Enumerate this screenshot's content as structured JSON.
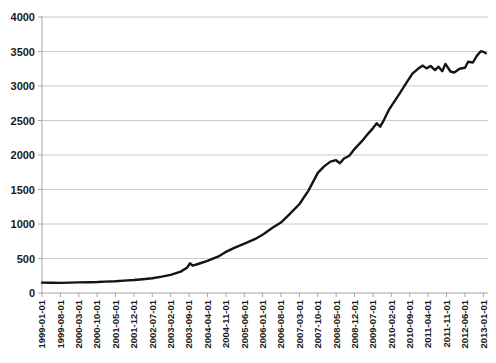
{
  "chart": {
    "background": "#ffffff",
    "line_color": "#141414",
    "grid_color": "#c9c9c9",
    "axis_color": "#a6a6a6",
    "label_color": "#1a1a1a"
  },
  "chart_data": {
    "type": "line",
    "title": "",
    "xlabel": "",
    "ylabel": "",
    "legend": "none",
    "grid": "horizontal",
    "ylim": [
      0,
      4000
    ],
    "y_ticks": [
      0,
      500,
      1000,
      1500,
      2000,
      2500,
      3000,
      3500,
      4000
    ],
    "y_tick_labels": [
      "0",
      "500",
      "1000",
      "1500",
      "2000",
      "2500",
      "3000",
      "3500",
      "4000"
    ],
    "x_tick_labels": [
      "1999-01-01",
      "1999-08-01",
      "2000-03-01",
      "2000-10-01",
      "2001-05-01",
      "2001-12-01",
      "2002-07-01",
      "2003-02-01",
      "2003-09-01",
      "2004-04-01",
      "2004-11-01",
      "2005-06-01",
      "2006-01-01",
      "2006-08-01",
      "2007-03-01",
      "2007-10-01",
      "2008-05-01",
      "2008-12-01",
      "2009-07-01",
      "2010-02-01",
      "2010-09-01",
      "2011-04-01",
      "2011-11-01",
      "2012-06-01",
      "2013-01-01"
    ],
    "x_tick_interval_months": 7,
    "xlim_years": [
      1999.0,
      2013.15
    ],
    "series": [
      {
        "name": "series-1",
        "points": [
          [
            1999.0,
            150
          ],
          [
            1999.3,
            148
          ],
          [
            1999.58,
            147
          ],
          [
            1999.9,
            150
          ],
          [
            2000.17,
            153
          ],
          [
            2000.5,
            156
          ],
          [
            2000.75,
            160
          ],
          [
            2001.0,
            165
          ],
          [
            2001.33,
            171
          ],
          [
            2001.6,
            179
          ],
          [
            2001.92,
            189
          ],
          [
            2002.2,
            200
          ],
          [
            2002.5,
            215
          ],
          [
            2002.8,
            237
          ],
          [
            2003.08,
            262
          ],
          [
            2003.4,
            310
          ],
          [
            2003.6,
            365
          ],
          [
            2003.7,
            430
          ],
          [
            2003.78,
            395
          ],
          [
            2003.95,
            420
          ],
          [
            2004.25,
            465
          ],
          [
            2004.6,
            530
          ],
          [
            2004.83,
            595
          ],
          [
            2005.1,
            655
          ],
          [
            2005.42,
            715
          ],
          [
            2005.75,
            780
          ],
          [
            2006.0,
            845
          ],
          [
            2006.3,
            940
          ],
          [
            2006.58,
            1020
          ],
          [
            2006.85,
            1140
          ],
          [
            2007.17,
            1290
          ],
          [
            2007.45,
            1480
          ],
          [
            2007.75,
            1740
          ],
          [
            2007.95,
            1835
          ],
          [
            2008.15,
            1905
          ],
          [
            2008.33,
            1925
          ],
          [
            2008.45,
            1880
          ],
          [
            2008.58,
            1950
          ],
          [
            2008.75,
            1990
          ],
          [
            2008.92,
            2090
          ],
          [
            2009.15,
            2200
          ],
          [
            2009.35,
            2310
          ],
          [
            2009.5,
            2390
          ],
          [
            2009.62,
            2460
          ],
          [
            2009.73,
            2410
          ],
          [
            2009.85,
            2510
          ],
          [
            2010.0,
            2650
          ],
          [
            2010.17,
            2770
          ],
          [
            2010.33,
            2880
          ],
          [
            2010.58,
            3060
          ],
          [
            2010.75,
            3180
          ],
          [
            2010.92,
            3245
          ],
          [
            2011.08,
            3295
          ],
          [
            2011.2,
            3255
          ],
          [
            2011.33,
            3290
          ],
          [
            2011.47,
            3230
          ],
          [
            2011.58,
            3280
          ],
          [
            2011.7,
            3215
          ],
          [
            2011.8,
            3320
          ],
          [
            2011.96,
            3210
          ],
          [
            2012.08,
            3195
          ],
          [
            2012.25,
            3250
          ],
          [
            2012.42,
            3265
          ],
          [
            2012.52,
            3350
          ],
          [
            2012.67,
            3340
          ],
          [
            2012.8,
            3440
          ],
          [
            2012.92,
            3505
          ],
          [
            2013.0,
            3495
          ],
          [
            2013.08,
            3475
          ]
        ]
      }
    ]
  }
}
